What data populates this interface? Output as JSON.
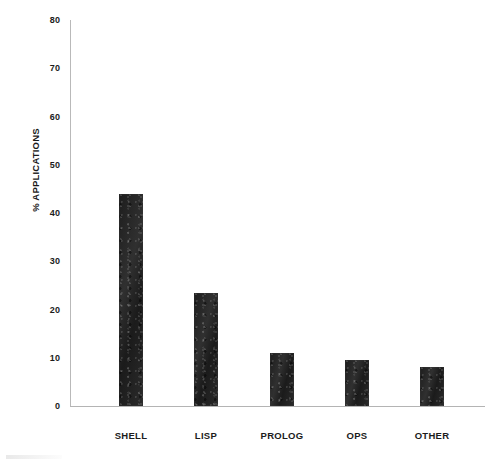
{
  "chart_data": {
    "type": "bar",
    "title": "",
    "xlabel": "",
    "ylabel": "% APPLICATIONS",
    "categories": [
      "SHELL",
      "LISP",
      "PROLOG",
      "OPS",
      "OTHER"
    ],
    "values": [
      44,
      23.5,
      11,
      9.5,
      8
    ],
    "ylim": [
      0,
      80
    ],
    "yticks": [
      0,
      10,
      20,
      30,
      40,
      50,
      60,
      70,
      80
    ],
    "ytick_labels": [
      "0",
      "10",
      "20",
      "30",
      "40",
      "50",
      "60",
      "70",
      "80"
    ],
    "grid": false,
    "legend": false,
    "bar_color": "#262626",
    "axis_color": "#b4b4b4",
    "background_color": "#ffffff"
  },
  "axes": {
    "y_title": "% APPLICATIONS"
  }
}
